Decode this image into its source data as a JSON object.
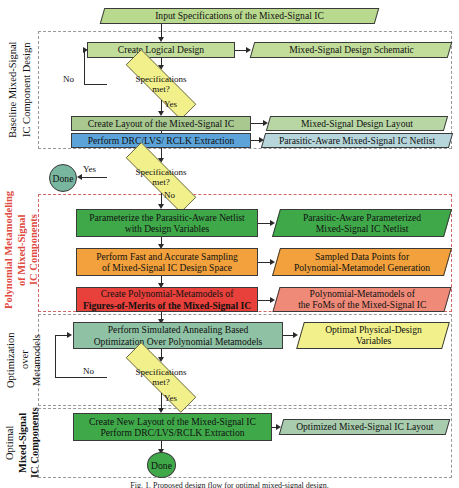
{
  "figure": {
    "caption": "Fig. 1. Proposed design flow for optimal mixed-signal design.",
    "background": "#ffffff"
  },
  "colors": {
    "light_green": "#c2dd9a",
    "mid_green_gray": "#a8c890",
    "teal_green": "#8fc2a4",
    "blue": "#5ba3d9",
    "strong_green": "#3fa94a",
    "orange": "#f2a13c",
    "red": "#e8403a",
    "salmon": "#ef8a78",
    "yellow": "#f2f08a",
    "teal": "#79b6a0",
    "sage": "#9ec4b2",
    "accent_red_text": "#e04a3f",
    "outline": "#3a3a3a",
    "dash_gray": "#999999",
    "dash_red": "#d06666"
  },
  "sections": [
    {
      "id": "baseline",
      "label_line1": "Baseline Mixed-Signal",
      "label_line2": "IC Component Design",
      "border_color": "#999999",
      "accent": false
    },
    {
      "id": "metamodeling",
      "label_line1": "Polynomial Metamodeling",
      "label_line2": "of Mixed-Signal",
      "label_line3": "IC Components",
      "border_color": "#d06666",
      "accent": true
    },
    {
      "id": "optimization",
      "label_line1": "Optimization",
      "label_line2": "over",
      "label_line3": "Metamodels",
      "border_color": "#999999",
      "accent": false
    },
    {
      "id": "optimal",
      "label_line1": "Optimal",
      "label_line2": "Mixed-Signal",
      "label_line3": "IC Components",
      "border_color": "#999999",
      "accent": false
    }
  ],
  "nodes": {
    "input_spec": "Input Specifications of the Mixed-Signal IC",
    "create_logical_design": "Create Logical Design",
    "design_schematic": "Mixed-Signal Design Schematic",
    "decision1": {
      "line1": "Specifications",
      "line2": "met?"
    },
    "create_layout": "Create Layout of the Mixed-Signal IC",
    "design_layout": "Mixed-Signal Design Layout",
    "perform_drc": "Perform DRC/LVS/ RCLK Extraction",
    "parasitic_netlist": "Parasitic-Aware Mixed-Signal IC Netlist",
    "decision2": {
      "line1": "Specifications",
      "line2": "met?"
    },
    "done_top": "Done",
    "parameterize": {
      "line1": "Parameterize the Parasitic-Aware Netlist",
      "line2": "with Design Variables"
    },
    "parameterized_netlist": {
      "line1": "Parasitic-Aware Parameterized",
      "line2": "Mixed-Signal IC Netlist"
    },
    "sampling": {
      "line1": "Perform Fast and Accurate Sampling",
      "line2": "of Mixed-Signal IC Design Space"
    },
    "sampled_points": {
      "line1": "Sampled Data Points for",
      "line2": "Polynomial-Metamodel Generation"
    },
    "create_metamodels": {
      "line1": "Create Polynomial-Metamodels of",
      "line2": "Figures-of-Merits of the Mixed-Signal IC"
    },
    "metamodels_foms": {
      "line1": "Polynomial-Metamodels of",
      "line2": "the FoMs of the Mixed-Signal IC"
    },
    "simulated_annealing": {
      "line1": "Perform Simulated Annealing Based",
      "line2": "Optimization Over Polynomial Metamodels"
    },
    "optimal_variables": {
      "line1": "Optimal Physical-Design",
      "line2": "Variables"
    },
    "decision3": {
      "line1": "Specifications",
      "line2": "met?"
    },
    "create_new_layout": {
      "line1": "Create New Layout of the Mixed-Signal IC",
      "line2": "Perform DRC/LVS/RCLK Extraction"
    },
    "optimized_layout": "Optimized Mixed-Signal IC Layout",
    "done_bottom": "Done"
  },
  "edge_labels": {
    "no1": "No",
    "yes1": "Yes",
    "yes2": "Yes",
    "no2": "No",
    "no3": "No",
    "yes3": "Yes"
  }
}
